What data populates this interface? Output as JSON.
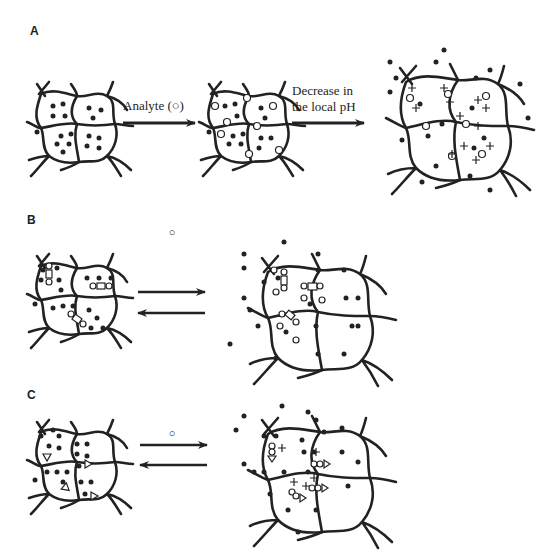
{
  "figure": {
    "panels": [
      {
        "label": "A",
        "steps": [
          {
            "arrow_label": "Analyte (○)"
          },
          {
            "arrow_label_line1": "Decrease in",
            "arrow_label_line2": "the local pH"
          }
        ]
      },
      {
        "label": "B",
        "arrow_label": "○",
        "arrow_type": "reversible"
      },
      {
        "label": "C",
        "arrow_label": "○",
        "arrow_type": "reversible"
      }
    ],
    "legend_symbols": {
      "filled_dot": "drug/solute molecule",
      "open_circle": "analyte",
      "plus": "positive charge",
      "rectangle": "receptor/binding site",
      "triangle": "receptor/binding site"
    },
    "colors": {
      "ink": "#222222",
      "background": "#ffffff"
    }
  }
}
